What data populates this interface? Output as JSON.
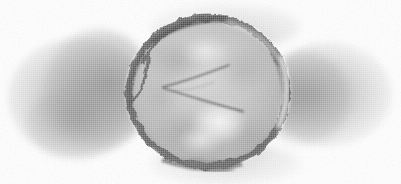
{
  "figure": {
    "kind": "transmission-electron-micrograph",
    "subject_label": "enveloped virus particle",
    "caption": "",
    "scale_bar_label": "",
    "annotation_text": "",
    "width_px": 401,
    "height_px": 184
  },
  "colors": {
    "background": "#ffffff",
    "stain_cloud": "#8c8c8c",
    "envelope_rim_dark": "#4a4a4a",
    "envelope_rim_mid": "#6e6e6e",
    "capsid_interior": "#b4b4b4",
    "interior_highlight": "#f2f2f2",
    "internal_filament": "#3a3a3a",
    "halo": "#e8e8e8"
  },
  "particle": {
    "name": "virus-particle",
    "center_x": 208,
    "center_y": 93,
    "radius_x": 83,
    "radius_y": 78,
    "envelope_thickness_px": 9,
    "interior_tone": "#b6b6b6",
    "rim_tone": "#4f4f4f"
  },
  "internal_structures": [
    {
      "name": "filament-upper",
      "x1": 163,
      "y1": 88,
      "x2": 229,
      "y2": 66
    },
    {
      "name": "filament-lower",
      "x1": 163,
      "y1": 89,
      "x2": 243,
      "y2": 112
    },
    {
      "name": "filament-short-tail",
      "x1": 198,
      "y1": 100,
      "x2": 243,
      "y2": 113
    }
  ],
  "highlights": [
    {
      "name": "interior-bright-blob",
      "cx": 219,
      "cy": 124,
      "rx": 26,
      "ry": 20
    },
    {
      "name": "interior-bright-patch-top",
      "cx": 206,
      "cy": 52,
      "rx": 22,
      "ry": 14
    },
    {
      "name": "rim-halo-right",
      "cx": 281,
      "cy": 78,
      "rx": 11,
      "ry": 44
    }
  ],
  "stain_clouds": [
    {
      "name": "stain-left-outer",
      "cx": 78,
      "cy": 98,
      "rx": 70,
      "ry": 60
    },
    {
      "name": "stain-left-inner",
      "cx": 99,
      "cy": 89,
      "rx": 55,
      "ry": 59
    },
    {
      "name": "stain-left-lobe",
      "cx": 74,
      "cy": 123,
      "rx": 48,
      "ry": 35
    },
    {
      "name": "stain-right-outer",
      "cx": 330,
      "cy": 94,
      "rx": 62,
      "ry": 52
    },
    {
      "name": "stain-right-inner",
      "cx": 304,
      "cy": 98,
      "rx": 46,
      "ry": 46
    },
    {
      "name": "stain-top-wisp",
      "cx": 225,
      "cy": 27,
      "rx": 75,
      "ry": 23
    },
    {
      "name": "stain-bottom-wisp",
      "cx": 225,
      "cy": 164,
      "rx": 75,
      "ry": 22
    }
  ]
}
